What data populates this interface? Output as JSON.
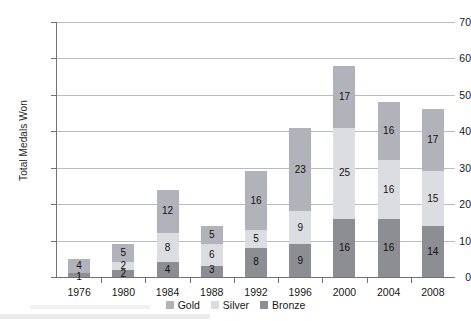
{
  "chart_data": {
    "type": "bar",
    "stacked": true,
    "title": "",
    "xlabel": "",
    "ylabel": "Total Medals Won",
    "ylim": [
      0,
      70
    ],
    "ytick_step": 10,
    "yticks": [
      0,
      10,
      20,
      30,
      40,
      50,
      60,
      70
    ],
    "grid": true,
    "legend_position": "bottom",
    "categories": [
      "1976",
      "1980",
      "1984",
      "1988",
      "1992",
      "1996",
      "2000",
      "2004",
      "2008"
    ],
    "series": [
      {
        "name": "Bronze",
        "color": "#8d8d94",
        "values": [
          1,
          2,
          4,
          3,
          8,
          9,
          16,
          16,
          14
        ]
      },
      {
        "name": "Silver",
        "color": "#dcdde2",
        "values": [
          0,
          2,
          8,
          6,
          5,
          9,
          25,
          16,
          15
        ]
      },
      {
        "name": "Gold",
        "color": "#b2b3ba",
        "values": [
          4,
          5,
          12,
          5,
          16,
          23,
          17,
          16,
          17
        ]
      }
    ],
    "totals": [
      5,
      9,
      24,
      14,
      29,
      41,
      58,
      48,
      46
    ],
    "data_labels": {
      "1976": {
        "gold": "4",
        "silver": "",
        "bronze": "1"
      },
      "1980": {
        "gold": "5",
        "silver": "2",
        "bronze": "2"
      },
      "1984": {
        "gold": "12",
        "silver": "8",
        "bronze": "4"
      },
      "1988": {
        "gold": "5",
        "silver": "6",
        "bronze": "3"
      },
      "1992": {
        "gold": "16",
        "silver": "5",
        "bronze": "8"
      },
      "1996": {
        "gold": "23",
        "silver": "9",
        "bronze": "9"
      },
      "2000": {
        "gold": "17",
        "silver": "25",
        "bronze": "16"
      },
      "2004": {
        "gold": "16",
        "silver": "16",
        "bronze": "16"
      },
      "2008": {
        "gold": "17",
        "silver": "15",
        "bronze": "14"
      }
    }
  },
  "axis": {
    "y_title": "Total Medals Won",
    "y_tick_labels": [
      "0",
      "10",
      "20",
      "30",
      "40",
      "50",
      "60",
      "70"
    ],
    "x_tick_labels": [
      "1976",
      "1980",
      "1984",
      "1988",
      "1992",
      "1996",
      "2000",
      "2004",
      "2008"
    ]
  },
  "legend": {
    "items": [
      {
        "label": "Gold",
        "color": "#b2b3ba"
      },
      {
        "label": "Silver",
        "color": "#dcdde2"
      },
      {
        "label": "Bronze",
        "color": "#8d8d94"
      }
    ]
  }
}
